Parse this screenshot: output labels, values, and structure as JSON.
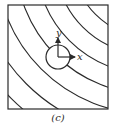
{
  "figure": {
    "caption": "(c)",
    "axes": {
      "x_label": "x",
      "y_label": "y"
    },
    "colors": {
      "stroke": "#2a2a2a",
      "background": "#ffffff"
    },
    "box": {
      "x": 8,
      "y": 5,
      "width": 100,
      "height": 104
    },
    "circle": {
      "cx": 58,
      "cy": 57,
      "r": 12
    },
    "contours": {
      "center": {
        "x": 150,
        "y": -40
      },
      "radii": [
        58,
        77,
        95,
        114,
        134,
        154,
        175,
        196,
        217
      ]
    }
  }
}
